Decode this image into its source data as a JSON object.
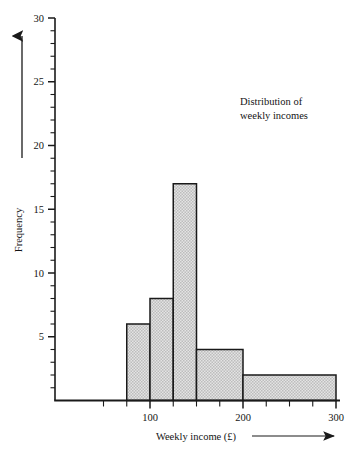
{
  "chart_data": {
    "type": "bar",
    "title": "",
    "annotation": "Distribution of\nweekly incomes",
    "annotation_line1": "Distribution of",
    "annotation_line2": "weekly incomes",
    "xlabel": "Weekly income (£)",
    "ylabel": "Frequency",
    "xlim": [
      50,
      300
    ],
    "ylim": [
      0,
      30
    ],
    "grid": false,
    "legend": null,
    "histogram": true,
    "bin_edges": [
      75,
      100,
      125,
      150,
      200,
      300
    ],
    "categories": [
      "75–100",
      "100–125",
      "125–150",
      "150–200",
      "200–300"
    ],
    "values": [
      6,
      8,
      17,
      4,
      2
    ],
    "bars": [
      {
        "from": 75,
        "to": 100,
        "frequency": 6
      },
      {
        "from": 100,
        "to": 125,
        "frequency": 8
      },
      {
        "from": 125,
        "to": 150,
        "frequency": 17
      },
      {
        "from": 150,
        "to": 200,
        "frequency": 4
      },
      {
        "from": 200,
        "to": 300,
        "frequency": 2
      }
    ],
    "x_tick_labels": [
      "100",
      "200",
      "300"
    ],
    "x_tick_values": [
      100,
      200,
      300
    ],
    "x_minor_tick_step": 25,
    "y_tick_labels": [
      "5",
      "10",
      "15",
      "20",
      "25",
      "30"
    ],
    "y_tick_values": [
      5,
      10,
      15,
      20,
      25,
      30
    ],
    "y_minor_tick_step": 1,
    "colors": {
      "bar_fill": "#d2d2d2",
      "bar_edge": "#1a1a1a",
      "axis": "#1a1a1a",
      "text": "#141414",
      "background": "#ffffff"
    }
  },
  "labels": {
    "y_axis_arrow": "up-arrow",
    "x_axis_arrow": "right-arrow"
  }
}
